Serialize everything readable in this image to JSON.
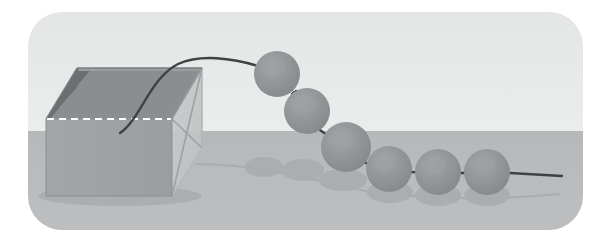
{
  "figure": {
    "name": "chain-of-beads-leaving-box",
    "canvas": {
      "width": 611,
      "height": 242
    },
    "background_color": "#ffffff"
  },
  "backdrop": {
    "name": "rounded-panel",
    "x": 28,
    "y": 12,
    "width": 555,
    "height": 218,
    "corner_radius": 34,
    "sky_color": "#e8e9e9",
    "ground_color": "#b8babb",
    "horizon_y": 131
  },
  "box": {
    "name": "open-box",
    "front_face_color": "#a0a3a5",
    "inner_back_color": "#8b8e90",
    "inner_left_color": "#6f7375",
    "rim_color": "#9a9d9f",
    "side_panel_color": "#c2c4c5",
    "edge_color": "#7e8183",
    "dashed_edge_color": "#ffffff",
    "shadow_color": "#a3a6a7",
    "front_top_left": [
      46,
      119
    ],
    "front_top_right": [
      172,
      119
    ],
    "front_bottom_left": [
      46,
      196
    ],
    "front_bottom_right": [
      172,
      196
    ],
    "back_top_left": [
      77,
      68
    ],
    "back_top_right": [
      202,
      68
    ],
    "side_bottom_right": [
      202,
      148
    ],
    "cross_line_color": "#9ea1a3"
  },
  "string": {
    "name": "bead-string",
    "color": "#3e4244",
    "width": 2.4,
    "start_point": [
      120,
      133
    ],
    "arc_peak": [
      205,
      59
    ],
    "end_point": [
      562,
      174
    ]
  },
  "beads": [
    {
      "name": "bead-1",
      "cx": 277,
      "cy": 74,
      "r": 23,
      "fill": "#8e9193",
      "highlight": "#9ea1a3"
    },
    {
      "name": "bead-2",
      "cx": 307,
      "cy": 111,
      "r": 23,
      "fill": "#8e9193",
      "highlight": "#9ea1a3"
    },
    {
      "name": "bead-3",
      "cx": 346,
      "cy": 147,
      "r": 25,
      "fill": "#8e9193",
      "highlight": "#9ea1a3"
    },
    {
      "name": "bead-4",
      "cx": 389,
      "cy": 169,
      "r": 23,
      "fill": "#8e9193",
      "highlight": "#9ea1a3"
    },
    {
      "name": "bead-5",
      "cx": 438,
      "cy": 172,
      "r": 23,
      "fill": "#8e9193",
      "highlight": "#9ea1a3"
    },
    {
      "name": "bead-6",
      "cx": 487,
      "cy": 172,
      "r": 23,
      "fill": "#8e9193",
      "highlight": "#9ea1a3"
    }
  ],
  "shadows": {
    "name": "ground-shadows",
    "color": "#a6a9aa",
    "ellipses": [
      {
        "name": "shadow-box",
        "cx": 120,
        "cy": 196,
        "rx": 82,
        "ry": 10
      },
      {
        "name": "shadow-trail-1",
        "cx": 264,
        "cy": 167,
        "rx": 19,
        "ry": 10
      },
      {
        "name": "shadow-trail-2",
        "cx": 303,
        "cy": 170,
        "rx": 21,
        "ry": 11
      },
      {
        "name": "shadow-bead-3",
        "cx": 343,
        "cy": 180,
        "rx": 24,
        "ry": 11
      },
      {
        "name": "shadow-bead-4",
        "cx": 390,
        "cy": 192,
        "rx": 23,
        "ry": 11
      },
      {
        "name": "shadow-bead-5",
        "cx": 438,
        "cy": 195,
        "rx": 23,
        "ry": 11
      },
      {
        "name": "shadow-bead-6",
        "cx": 487,
        "cy": 195,
        "rx": 23,
        "ry": 11
      }
    ],
    "trail_line": {
      "name": "shadow-string",
      "color": "#a4a7a8",
      "width": 2.2
    }
  }
}
